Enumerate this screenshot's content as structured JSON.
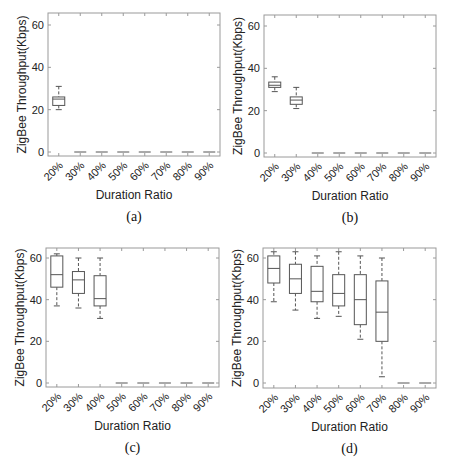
{
  "chart_data": [
    {
      "type": "box",
      "caption": "(a)",
      "xlabel": "Duration Ratio",
      "ylabel": "ZigBee Throughput(Kbps)",
      "ylim": [
        -2,
        65
      ],
      "yticks": [
        0,
        20,
        40,
        60
      ],
      "categories": [
        "20%",
        "30%",
        "40%",
        "50%",
        "60%",
        "70%",
        "80%",
        "90%"
      ],
      "boxes": [
        {
          "min": 20,
          "q1": 22,
          "median": 25,
          "q3": 26,
          "max": 31
        },
        {
          "min": 0,
          "q1": 0,
          "median": 0,
          "q3": 0,
          "max": 0
        },
        {
          "min": 0,
          "q1": 0,
          "median": 0,
          "q3": 0,
          "max": 0
        },
        {
          "min": 0,
          "q1": 0,
          "median": 0,
          "q3": 0,
          "max": 0
        },
        {
          "min": 0,
          "q1": 0,
          "median": 0,
          "q3": 0,
          "max": 0
        },
        {
          "min": 0,
          "q1": 0,
          "median": 0,
          "q3": 0,
          "max": 0
        },
        {
          "min": 0,
          "q1": 0,
          "median": 0,
          "q3": 0,
          "max": 0
        },
        {
          "min": 0,
          "q1": 0,
          "median": 0,
          "q3": 0,
          "max": 0
        }
      ],
      "frame": {
        "x0": 48,
        "x1": 220,
        "y0": 13,
        "y1": 156,
        "yAt60": 25,
        "yAt0": 152
      }
    },
    {
      "type": "box",
      "caption": "(b)",
      "xlabel": "Duration Ratio",
      "ylabel": "ZigBee Throughput(Kbps)",
      "ylim": [
        -2,
        65
      ],
      "yticks": [
        0,
        20,
        40,
        60
      ],
      "categories": [
        "20%",
        "30%",
        "40%",
        "50%",
        "60%",
        "70%",
        "80%",
        "90%"
      ],
      "boxes": [
        {
          "min": 29,
          "q1": 31,
          "median": 32,
          "q3": 33.5,
          "max": 36
        },
        {
          "min": 21,
          "q1": 23,
          "median": 25,
          "q3": 26.5,
          "max": 31
        },
        {
          "min": 0,
          "q1": 0,
          "median": 0,
          "q3": 0,
          "max": 0
        },
        {
          "min": 0,
          "q1": 0,
          "median": 0,
          "q3": 0,
          "max": 0
        },
        {
          "min": 0,
          "q1": 0,
          "median": 0,
          "q3": 0,
          "max": 0
        },
        {
          "min": 0,
          "q1": 0,
          "median": 0,
          "q3": 0,
          "max": 0
        },
        {
          "min": 0,
          "q1": 0,
          "median": 0,
          "q3": 0,
          "max": 0
        },
        {
          "min": 0,
          "q1": 0,
          "median": 0,
          "q3": 0,
          "max": 0
        }
      ],
      "frame": {
        "x0": 264,
        "x1": 436,
        "y0": 15,
        "y1": 157,
        "yAt60": 26,
        "yAt0": 153
      }
    },
    {
      "type": "box",
      "caption": "(c)",
      "xlabel": "Duration Ratio",
      "ylabel": "ZigBee Throughput(Kbps)",
      "ylim": [
        -2,
        65
      ],
      "yticks": [
        0,
        20,
        40,
        60
      ],
      "categories": [
        "20%",
        "30%",
        "40%",
        "50%",
        "60%",
        "70%",
        "80%",
        "90%"
      ],
      "boxes": [
        {
          "min": 37,
          "q1": 46,
          "median": 52,
          "q3": 61,
          "max": 62
        },
        {
          "min": 36,
          "q1": 43,
          "median": 49.5,
          "q3": 53.5,
          "max": 60
        },
        {
          "min": 31,
          "q1": 37,
          "median": 40.5,
          "q3": 51.5,
          "max": 60
        },
        {
          "min": 0,
          "q1": 0,
          "median": 0,
          "q3": 0,
          "max": 0
        },
        {
          "min": 0,
          "q1": 0,
          "median": 0,
          "q3": 0,
          "max": 0
        },
        {
          "min": 0,
          "q1": 0,
          "median": 0,
          "q3": 0,
          "max": 0
        },
        {
          "min": 0,
          "q1": 0,
          "median": 0,
          "q3": 0,
          "max": 0
        },
        {
          "min": 0,
          "q1": 0,
          "median": 0,
          "q3": 0,
          "max": 0
        }
      ],
      "frame": {
        "x0": 46,
        "x1": 219,
        "y0": 248,
        "y1": 387,
        "yAt60": 258,
        "yAt0": 383
      }
    },
    {
      "type": "box",
      "caption": "(d)",
      "xlabel": "Duration Ratio",
      "ylabel": "ZigBee Throughput(Kbps)",
      "ylim": [
        -2,
        65
      ],
      "yticks": [
        0,
        20,
        40,
        60
      ],
      "categories": [
        "20%",
        "30%",
        "40%",
        "50%",
        "60%",
        "70%",
        "80%",
        "90%"
      ],
      "boxes": [
        {
          "min": 39,
          "q1": 48,
          "median": 55,
          "q3": 61,
          "max": 63
        },
        {
          "min": 35,
          "q1": 43,
          "median": 50,
          "q3": 57,
          "max": 63
        },
        {
          "min": 31,
          "q1": 39,
          "median": 44,
          "q3": 56,
          "max": 61
        },
        {
          "min": 32,
          "q1": 37,
          "median": 43,
          "q3": 52,
          "max": 63
        },
        {
          "min": 21,
          "q1": 28,
          "median": 40,
          "q3": 52,
          "max": 61
        },
        {
          "min": 3,
          "q1": 20,
          "median": 34,
          "q3": 49,
          "max": 60
        },
        {
          "min": 0,
          "q1": 0,
          "median": 0,
          "q3": 0,
          "max": 0
        },
        {
          "min": 0,
          "q1": 0,
          "median": 0,
          "q3": 0,
          "max": 0
        }
      ],
      "frame": {
        "x0": 263,
        "x1": 436,
        "y0": 248,
        "y1": 388,
        "yAt60": 258,
        "yAt0": 383
      }
    }
  ],
  "colors": {
    "axis": "#9a9a9a",
    "box": "#555555",
    "text": "#222222"
  }
}
